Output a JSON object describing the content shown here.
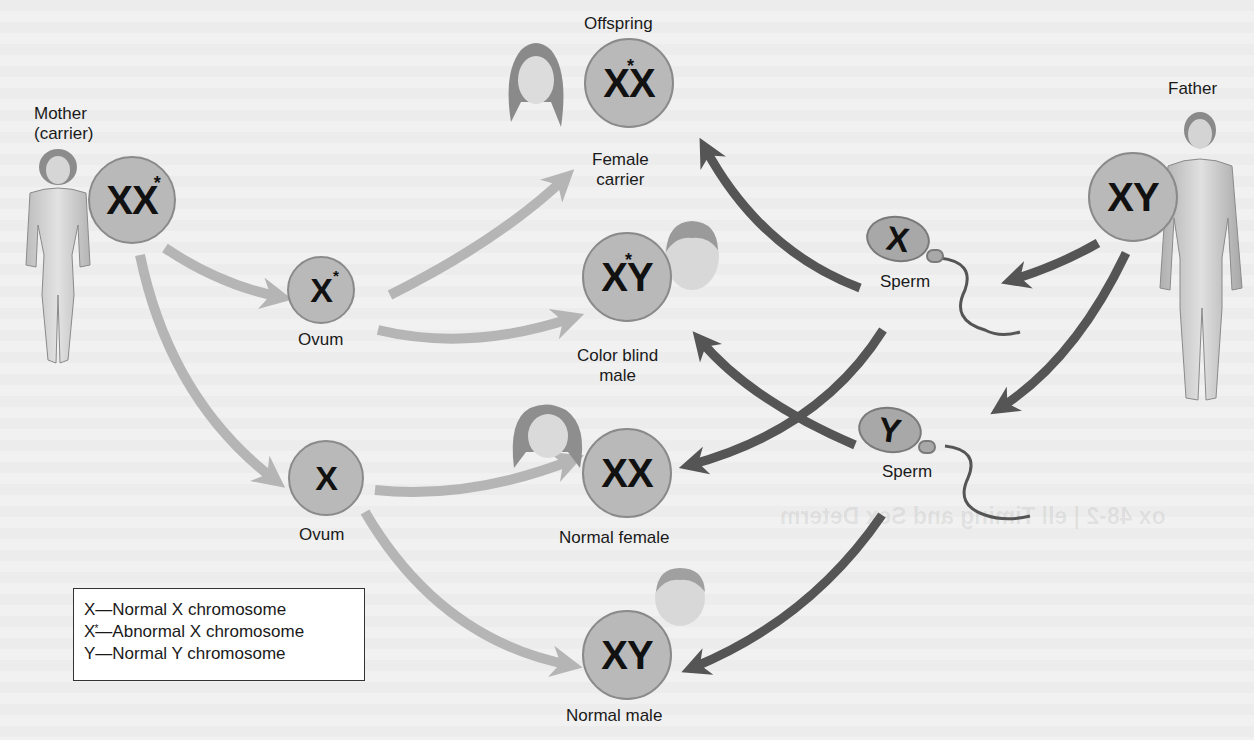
{
  "diagram": {
    "colors": {
      "circle_fill": "#b9b9b9",
      "maternal_arrow": "#b5b5b5",
      "paternal_arrow": "#555555",
      "background": "#f1f1f1"
    },
    "parents": {
      "mother": {
        "label_line1": "Mother",
        "label_line2": "(carrier)",
        "genotype_a": "X",
        "genotype_b": "X",
        "abnormal_mark": "*"
      },
      "father": {
        "label": "Father",
        "genotype": "XY"
      }
    },
    "gametes": {
      "ovum_abnormal": {
        "genotype": "X",
        "abnormal_mark": "*",
        "label": "Ovum"
      },
      "ovum_normal": {
        "genotype": "X",
        "label": "Ovum"
      },
      "sperm_x": {
        "genotype": "X",
        "label": "Sperm"
      },
      "sperm_y": {
        "genotype": "Y",
        "label": "Sperm"
      }
    },
    "offspring_header": "Offspring",
    "offspring": [
      {
        "id": "female-carrier",
        "genotype_a": "X",
        "genotype_b": "X",
        "abnormal_mark": "*",
        "label_line1": "Female",
        "label_line2": "carrier"
      },
      {
        "id": "color-blind-male",
        "genotype_a": "X",
        "genotype_b": "Y",
        "abnormal_mark": "*",
        "label_line1": "Color blind",
        "label_line2": "male"
      },
      {
        "id": "normal-female",
        "genotype": "XX",
        "label": "Normal female"
      },
      {
        "id": "normal-male",
        "genotype": "XY",
        "label": "Normal male"
      }
    ],
    "legend": [
      {
        "symbol": "X",
        "text": "—Normal X chromosome"
      },
      {
        "symbol": "X",
        "abnormal": true,
        "text": "—Abnormal X chromosome"
      },
      {
        "symbol": "Y",
        "text": "—Normal Y chromosome"
      }
    ],
    "background_bleed_text": "ox 48-2 | ell Timing and Sex Determ"
  }
}
